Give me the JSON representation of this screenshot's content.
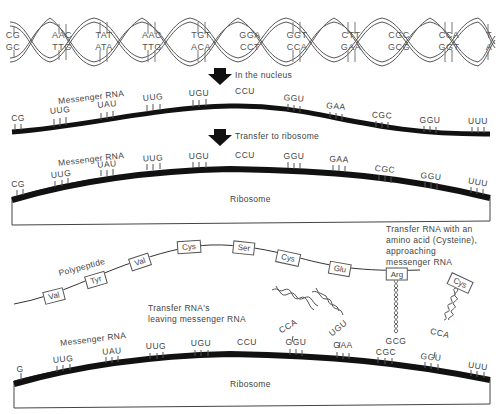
{
  "diagram": {
    "dna": {
      "top_strand": [
        "CG",
        "AAC",
        "TAT",
        "AAC",
        "TGT",
        "GGA",
        "GGT",
        "CTT",
        "CGC",
        "CCA",
        "T"
      ],
      "bottom_strand": [
        "GC",
        "TTG",
        "ATA",
        "TTG",
        "ACA",
        "CCT",
        "CCA",
        "GAA",
        "GCG",
        "GGT",
        "A"
      ]
    },
    "steps": [
      {
        "label": "In the nucleus"
      },
      {
        "label": "Transfer to ribosome"
      }
    ],
    "mrna_panel_1": {
      "label": "Messenger RNA",
      "codons": [
        "CG",
        "UUG",
        "UAU",
        "UUG",
        "UGU",
        "CCU",
        "GGU",
        "GAA",
        "CGC",
        "GGU",
        "UUU"
      ]
    },
    "mrna_panel_2": {
      "label": "Messenger RNA",
      "codons": [
        "CG",
        "UUG",
        "UAU",
        "UUG",
        "UGU",
        "CCU",
        "GGU",
        "GAA",
        "CGC",
        "GGU",
        "UUU"
      ],
      "ribosome_label": "Ribosome"
    },
    "translation_panel": {
      "polypeptide_label": "Polypeptide",
      "amino_acids": [
        "Val",
        "Tyr",
        "Val",
        "Cys",
        "Ser",
        "Cys",
        "Glu",
        "Arg"
      ],
      "incoming_amino_acid": "Cys",
      "trna_leaving_note": [
        "Transfer RNA's",
        "leaving messenger RNA"
      ],
      "trna_approaching_note": [
        "Transfer RNA with an",
        "amino acid (Cysteine),",
        "approaching",
        "messenger RNA"
      ],
      "trna_anticodons": [
        "CCA",
        "UGU",
        "GCG",
        "CCA"
      ],
      "mrna_label": "Messenger RNA",
      "codons": [
        "G",
        "UUG",
        "UAU",
        "UUG",
        "UGU",
        "CCU",
        "GGU",
        "GAA",
        "CGC",
        "GGU",
        "UUU"
      ],
      "ribosome_label": "Ribosome"
    }
  }
}
